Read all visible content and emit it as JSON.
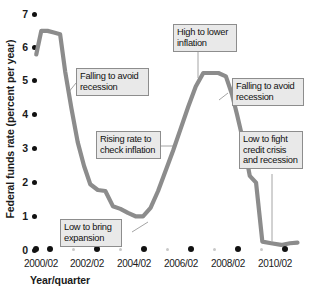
{
  "chart_data": {
    "type": "line",
    "title": "",
    "xlabel": "Year/quarter",
    "ylabel": "Federal funds rate (percent per year)",
    "ylim": [
      0,
      7
    ],
    "xlim": [
      2000.0,
      2010.5
    ],
    "grid": false,
    "legend": false,
    "line_color": "#8c8c8c",
    "yticks": [
      "0",
      "1",
      "2",
      "3",
      "4",
      "5",
      "6",
      "7"
    ],
    "xticks": [
      "2000/02",
      "2002/02",
      "2004/02",
      "2006/02",
      "2008/02",
      "2010/02"
    ],
    "x": [
      2000.05,
      2000.25,
      2000.5,
      2000.75,
      2001.0,
      2001.2,
      2001.45,
      2001.7,
      2001.95,
      2002.2,
      2002.5,
      2002.8,
      2003.1,
      2003.4,
      2003.7,
      2004.0,
      2004.3,
      2004.6,
      2004.9,
      2005.2,
      2005.5,
      2005.8,
      2006.1,
      2006.4,
      2006.7,
      2007.0,
      2007.3,
      2007.6,
      2007.85,
      2008.05,
      2008.3,
      2008.55,
      2008.8,
      2009.05,
      2009.4,
      2009.8,
      2010.15,
      2010.45
    ],
    "y": [
      5.8,
      6.5,
      6.5,
      6.45,
      6.4,
      5.3,
      4.2,
      3.2,
      2.5,
      1.95,
      1.78,
      1.75,
      1.3,
      1.22,
      1.1,
      1.0,
      1.0,
      1.25,
      1.75,
      2.35,
      2.95,
      3.6,
      4.25,
      4.85,
      5.25,
      5.25,
      5.25,
      5.15,
      4.6,
      4.0,
      3.2,
      2.2,
      2.0,
      0.25,
      0.2,
      0.15,
      0.2,
      0.22
    ],
    "series_name": "Federal funds rate",
    "annotations": [
      {
        "id": "falling-to-avoid-recession-left",
        "lines": [
          "Falling to avoid",
          "recession"
        ],
        "points_to": {
          "x": 2001.1,
          "y": 4.85
        }
      },
      {
        "id": "rising-rate-to-check-inflation",
        "lines": [
          "Rising rate to",
          "check inflation"
        ],
        "points_to": {
          "x": 2005.25,
          "y": 2.45
        }
      },
      {
        "id": "low-to-bring-expansion",
        "lines": [
          "Low to bring",
          "expansion"
        ],
        "points_to": {
          "x": 2004.05,
          "y": 1.0
        }
      },
      {
        "id": "high-to-lower-inflation",
        "lines": [
          "High to lower",
          "inflation"
        ],
        "points_to": {
          "x": 2006.95,
          "y": 5.25
        }
      },
      {
        "id": "falling-to-avoid-recession-right",
        "lines": [
          "Falling to avoid",
          "recession"
        ],
        "points_to": {
          "x": 2007.85,
          "y": 4.6
        }
      },
      {
        "id": "low-to-fight-credit-crisis",
        "lines": [
          "Low to fight",
          "credit crisis",
          "and recession"
        ],
        "points_to": {
          "x": 2009.55,
          "y": 0.18
        }
      }
    ]
  }
}
